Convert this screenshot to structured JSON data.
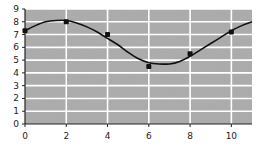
{
  "chart_data": {
    "type": "scatter",
    "title": "",
    "xlabel": "",
    "ylabel": "",
    "xlim": [
      0,
      11
    ],
    "ylim": [
      0,
      9
    ],
    "grid": true,
    "x_ticks": [
      0,
      2,
      4,
      6,
      8,
      10
    ],
    "y_ticks": [
      0,
      1,
      2,
      3,
      4,
      5,
      6,
      7,
      8,
      9
    ],
    "x_tick_labels": [
      "0",
      "2",
      "4",
      "6",
      "8",
      "10"
    ],
    "y_tick_labels": [
      "0",
      "1",
      "2",
      "3",
      "4",
      "5",
      "6",
      "7",
      "8",
      "9"
    ],
    "series": [
      {
        "name": "observations",
        "kind": "scatter",
        "x": [
          0,
          2,
          4,
          6,
          8,
          10
        ],
        "y": [
          7.3,
          8.0,
          7.0,
          4.5,
          5.5,
          7.2
        ]
      },
      {
        "name": "fitted-curve",
        "kind": "line",
        "x": [
          0,
          0.5,
          1,
          1.5,
          2,
          2.5,
          3,
          3.5,
          4,
          4.5,
          5,
          5.5,
          6,
          6.5,
          7,
          7.5,
          8,
          8.5,
          9,
          9.5,
          10,
          10.5,
          11
        ],
        "y": [
          7.3,
          7.7,
          8.0,
          8.1,
          8.1,
          7.9,
          7.6,
          7.2,
          6.7,
          6.2,
          5.6,
          5.1,
          4.8,
          4.7,
          4.7,
          4.9,
          5.3,
          5.8,
          6.3,
          6.8,
          7.3,
          7.7,
          8.0
        ]
      }
    ],
    "colors": {
      "plot_background": "#a8a8a8",
      "grid": "#ffffff",
      "markers": "#111111",
      "line": "#111111",
      "axis": "#222222"
    }
  }
}
